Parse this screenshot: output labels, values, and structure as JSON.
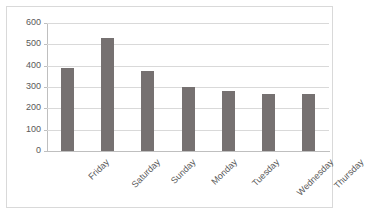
{
  "chart_data": {
    "type": "bar",
    "title": "",
    "xlabel": "",
    "ylabel": "",
    "categories": [
      "Friday",
      "Saturday",
      "Sunday",
      "Monday",
      "Tuesday",
      "Wednesday",
      "Thursday"
    ],
    "values": [
      390,
      530,
      373,
      300,
      280,
      267,
      265
    ],
    "ylim": [
      0,
      600
    ],
    "y_ticks": [
      0,
      100,
      200,
      300,
      400,
      500,
      600
    ],
    "y_tick_labels": [
      "0",
      "100",
      "200",
      "300",
      "400",
      "500",
      "600"
    ],
    "grid": true,
    "legend": false,
    "series": [
      {
        "name": "",
        "values": [
          390,
          530,
          373,
          300,
          280,
          267,
          265
        ],
        "color": "#767171"
      }
    ]
  },
  "style": {
    "bar_color": "#767171",
    "gridline_color": "#d9d9d9",
    "axis_color": "#bfbfbf",
    "frame_color": "#d9d9d9",
    "text_color": "#595959",
    "background": "#ffffff"
  }
}
